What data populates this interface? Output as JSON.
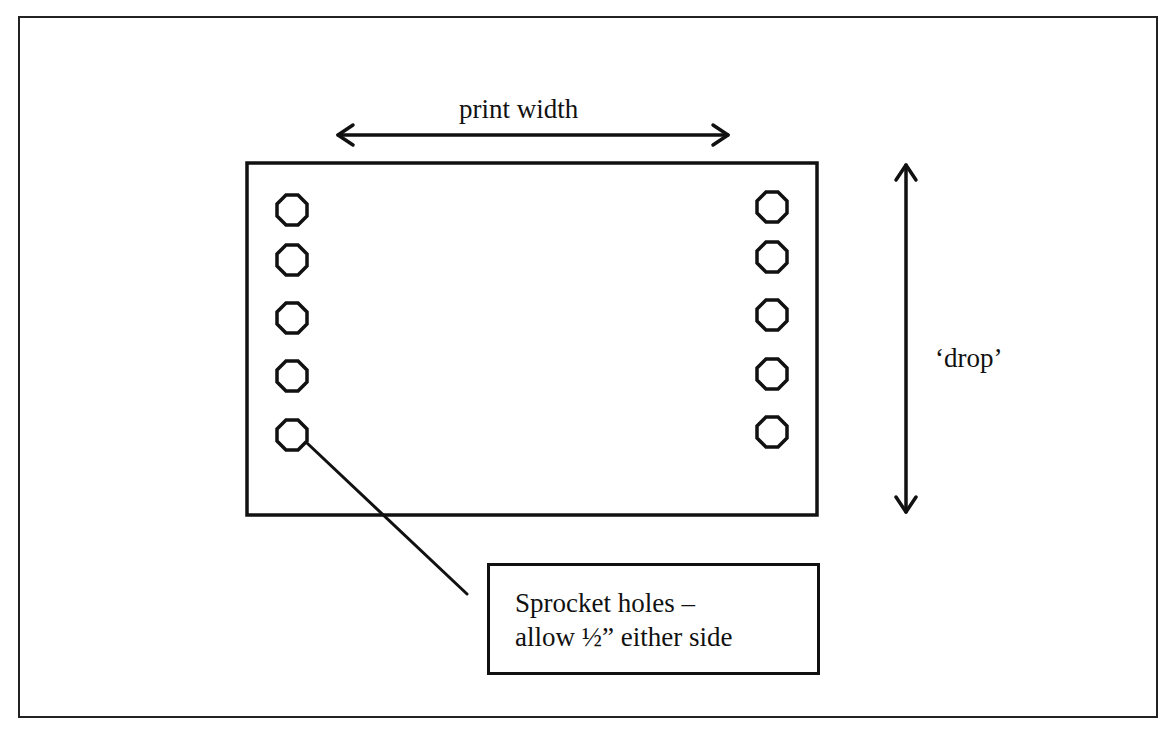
{
  "diagram": {
    "type": "annotated-schematic",
    "labels": {
      "print_width": "print width",
      "drop": "‘drop’",
      "callout_line1": "Sprocket holes –",
      "callout_line2": "allow ½” either side"
    },
    "sprocket_holes": {
      "left_column_count": 5,
      "right_column_count": 5,
      "shape": "octagon"
    },
    "arrows": [
      {
        "name": "print-width-arrow",
        "direction": "horizontal",
        "heads": "both"
      },
      {
        "name": "drop-arrow",
        "direction": "vertical",
        "heads": "both"
      }
    ],
    "colors": {
      "stroke": "#111111",
      "background": "#ffffff"
    }
  }
}
